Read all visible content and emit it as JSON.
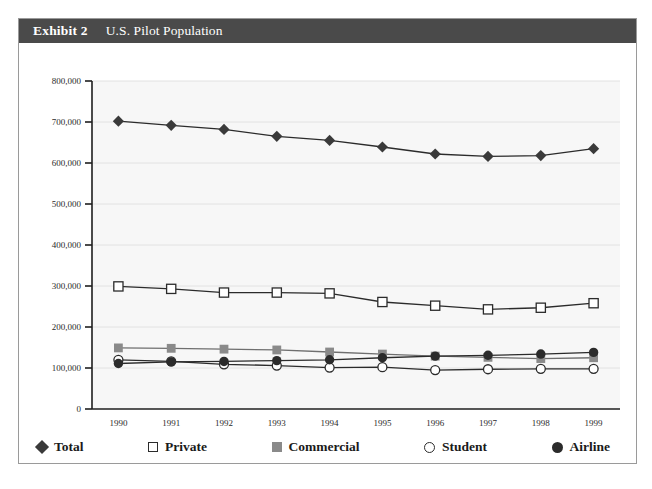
{
  "header": {
    "exhibit_number": "Exhibit 2",
    "title": "U.S. Pilot Population"
  },
  "legend": {
    "position": "bottom",
    "items": [
      {
        "label": "Total",
        "marker": "filled-diamond-icon",
        "color": "#3a3a3a"
      },
      {
        "label": "Private",
        "marker": "open-square-icon",
        "color": "#ffffff"
      },
      {
        "label": "Commercial",
        "marker": "filled-square-icon",
        "color": "#8a8a8a"
      },
      {
        "label": "Student",
        "marker": "open-circle-icon",
        "color": "#ffffff"
      },
      {
        "label": "Airline",
        "marker": "filled-circle-icon",
        "color": "#2b2b2b"
      }
    ]
  },
  "axes": {
    "y_ticks": [
      "800,000",
      "700,000",
      "600,000",
      "500,000",
      "400,000",
      "300,000",
      "200,000",
      "100,000",
      "0"
    ],
    "x_ticks": [
      "1990",
      "1991",
      "1992",
      "1993",
      "1994",
      "1995",
      "1996",
      "1997",
      "1998",
      "1999"
    ]
  },
  "chart_data": {
    "type": "line",
    "title": "U.S. Pilot Population",
    "xlabel": "",
    "ylabel": "",
    "x": [
      1990,
      1991,
      1992,
      1993,
      1994,
      1995,
      1996,
      1997,
      1998,
      1999
    ],
    "categories": [
      "1990",
      "1991",
      "1992",
      "1993",
      "1994",
      "1995",
      "1996",
      "1997",
      "1998",
      "1999"
    ],
    "ylim": [
      0,
      800000
    ],
    "ytick_step": 100000,
    "grid": true,
    "legend_position": "bottom",
    "plot_background": "#f7f7f7",
    "series": [
      {
        "name": "Total",
        "marker": "filled-diamond",
        "color": "#3a3a3a",
        "values": [
          702000,
          692000,
          682000,
          665000,
          655000,
          639000,
          622000,
          616000,
          618000,
          635000
        ]
      },
      {
        "name": "Private",
        "marker": "open-square",
        "color": "#2b2b2b",
        "values": [
          299000,
          293000,
          284000,
          284000,
          282000,
          261000,
          252000,
          243000,
          247000,
          258000
        ]
      },
      {
        "name": "Commercial",
        "marker": "filled-square",
        "color": "#8a8a8a",
        "values": [
          149000,
          148000,
          146000,
          144000,
          139000,
          134000,
          129000,
          126000,
          123000,
          125000
        ]
      },
      {
        "name": "Student",
        "marker": "open-circle",
        "color": "#2b2b2b",
        "values": [
          120000,
          116000,
          109000,
          106000,
          101000,
          102000,
          95000,
          97000,
          98000,
          98000
        ]
      },
      {
        "name": "Airline",
        "marker": "filled-circle",
        "color": "#2b2b2b",
        "values": [
          111000,
          115000,
          116000,
          118000,
          120000,
          125000,
          129000,
          131000,
          134000,
          138000
        ]
      }
    ]
  }
}
